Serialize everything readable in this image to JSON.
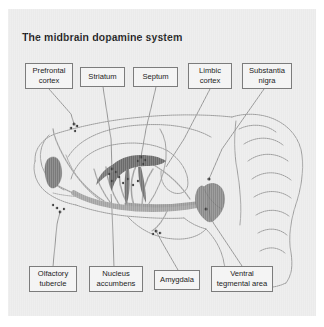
{
  "figure": {
    "title": "The midbrain dopamine system",
    "background_color": "#ebebeb",
    "page_background_color": "#ffffff"
  },
  "labels": {
    "top": [
      {
        "id": "prefrontal-cortex",
        "line1": "Prefrontal",
        "line2": "cortex"
      },
      {
        "id": "striatum",
        "line1": "Striatum",
        "line2": ""
      },
      {
        "id": "septum",
        "line1": "Septum",
        "line2": ""
      },
      {
        "id": "limbic-cortex",
        "line1": "Limbic",
        "line2": "cortex"
      },
      {
        "id": "substantia-nigra",
        "line1": "Substantia",
        "line2": "nigra"
      }
    ],
    "bottom": [
      {
        "id": "olfactory-tubercle",
        "line1": "Olfactory",
        "line2": "tubercle"
      },
      {
        "id": "nucleus-accumbens",
        "line1": "Nucleus",
        "line2": "accumbens"
      },
      {
        "id": "amygdala",
        "line1": "Amygdala",
        "line2": ""
      },
      {
        "id": "ventral-tegmental-area",
        "line1": "Ventral",
        "line2": "tegmental area"
      }
    ]
  },
  "illustration": {
    "description": "Sagittal section of a rodent brain showing midbrain dopamine pathways",
    "outline_color": "#8c8c8c",
    "pathway_color": "#9a9a9a",
    "nucleus_fill_dark": "#6e6e6e",
    "nucleus_fill_mid": "#8e8e8e",
    "terminal_dot_color": "#4a4a4a",
    "leader_line_color": "#6f6f6f"
  }
}
